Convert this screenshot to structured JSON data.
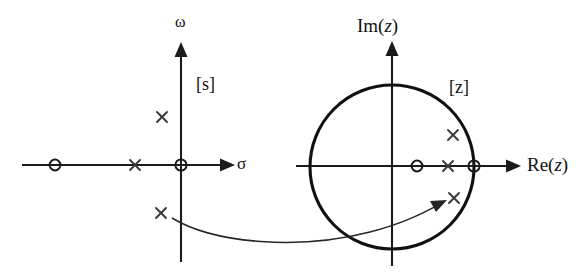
{
  "figure": {
    "width": 585,
    "height": 273,
    "background_color": "#ffffff",
    "ink_color": "#1b1b1b"
  },
  "s_plane": {
    "plane_label": "[s]",
    "real_axis_label": "σ",
    "imag_axis_label": "ω",
    "markers": [
      {
        "kind": "zero",
        "glyph": "circle",
        "label": "real-axis zero",
        "x": 55,
        "y": 165
      },
      {
        "kind": "pole",
        "glyph": "cross",
        "label": "real-axis pole",
        "x": 135,
        "y": 165
      },
      {
        "kind": "zero",
        "glyph": "circle",
        "label": "origin zero",
        "x": 181,
        "y": 165
      },
      {
        "kind": "pole",
        "glyph": "cross",
        "label": "upper complex pole",
        "x": 162,
        "y": 117
      },
      {
        "kind": "pole",
        "glyph": "cross",
        "label": "lower complex pole",
        "x": 161,
        "y": 213
      }
    ]
  },
  "z_plane": {
    "plane_label": "[z]",
    "real_axis_label": "Re(z)",
    "real_axis_label_prefix": "Re(",
    "real_axis_label_var": "z",
    "real_axis_label_suffix": ")",
    "imag_axis_label": "Im(z)",
    "imag_axis_label_prefix": "Im(",
    "imag_axis_label_var": "z",
    "imag_axis_label_suffix": ")",
    "unit_circle": {
      "center_x": 392,
      "center_y": 167,
      "radius": 82
    },
    "markers": [
      {
        "kind": "zero",
        "glyph": "circle",
        "label": "interior real-axis zero",
        "x": 417,
        "y": 166
      },
      {
        "kind": "pole",
        "glyph": "cross",
        "label": "interior real-axis pole",
        "x": 448,
        "y": 166
      },
      {
        "kind": "zero",
        "glyph": "circle",
        "label": "unit-circle zero at z=1",
        "x": 474,
        "y": 166
      },
      {
        "kind": "pole",
        "glyph": "cross",
        "label": "upper complex pole",
        "x": 453,
        "y": 135
      },
      {
        "kind": "pole",
        "glyph": "cross",
        "label": "lower complex pole",
        "x": 454,
        "y": 198
      }
    ]
  },
  "mapping_arrow": {
    "label": "mapping arrow from s-plane to z-plane",
    "start_x": 172,
    "start_y": 218,
    "end_x": 443,
    "end_y": 203
  }
}
